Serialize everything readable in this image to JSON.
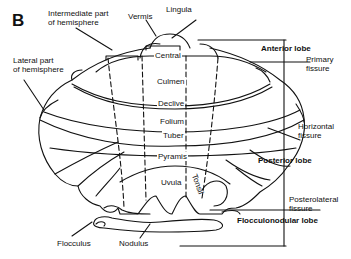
{
  "figure": {
    "panel_label": "B",
    "colors": {
      "line": "#111111",
      "background": "#ffffff"
    }
  },
  "labels": {
    "intermediate_part_line1": "Intermediate part",
    "intermediate_part_line2": "of hemisphere",
    "vermis": "Vermis",
    "lingula": "Lingula",
    "lateral_part_line1": "Lateral part",
    "lateral_part_line2": "of hemisphere",
    "flocculus": "Flocculus",
    "nodulus": "Nodulus"
  },
  "vermis_lobules": [
    {
      "name": "Central"
    },
    {
      "name": "Culmen"
    },
    {
      "name": "Declive"
    },
    {
      "name": "Folium"
    },
    {
      "name": "Tuber"
    },
    {
      "name": "Pyramis"
    },
    {
      "name": "Uvula"
    },
    {
      "name": "Tonsil"
    }
  ],
  "lobes": {
    "anterior": "Anterior lobe",
    "posterior": "Posterior lobe",
    "flocculonodular": "Flocculonodular lobe"
  },
  "fissures": {
    "primary_line1": "Primary",
    "primary_line2": "fissure",
    "horizontal_line1": "Horizontal",
    "horizontal_line2": "fissure",
    "posterolateral_line1": "Posterolateral",
    "posterolateral_line2": "fissure"
  }
}
